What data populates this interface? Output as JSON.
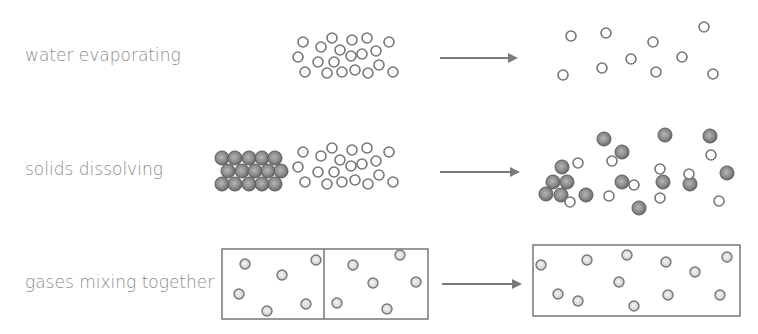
{
  "colors": {
    "text": "#8a8a8a",
    "outline": "#777777",
    "solid_fill": "#8c8c8c",
    "solid_stroke": "#5e5e5e",
    "arrow": "#7a7a7a",
    "box": "#777777",
    "gas_fill": "#e8e8e8"
  },
  "rows": [
    {
      "label": "water evaporating",
      "label_y": 42,
      "arrow": {
        "x1": 440,
        "x2": 516,
        "y": 58
      },
      "before_open": [
        [
          303,
          42
        ],
        [
          321,
          47
        ],
        [
          332,
          38
        ],
        [
          352,
          40
        ],
        [
          367,
          38
        ],
        [
          389,
          42
        ],
        [
          298,
          57
        ],
        [
          318,
          62
        ],
        [
          340,
          50
        ],
        [
          351,
          56
        ],
        [
          362,
          54
        ],
        [
          376,
          51
        ],
        [
          334,
          62
        ],
        [
          379,
          65
        ],
        [
          305,
          72
        ],
        [
          327,
          73
        ],
        [
          342,
          72
        ],
        [
          355,
          70
        ],
        [
          368,
          73
        ],
        [
          393,
          72
        ]
      ],
      "after_open": [
        [
          571,
          36
        ],
        [
          606,
          33
        ],
        [
          653,
          42
        ],
        [
          704,
          27
        ],
        [
          631,
          59
        ],
        [
          682,
          57
        ],
        [
          563,
          75
        ],
        [
          602,
          68
        ],
        [
          656,
          72
        ],
        [
          713,
          74
        ]
      ]
    },
    {
      "label": "solids dissolving",
      "label_y": 156,
      "arrow": {
        "x1": 440,
        "x2": 518,
        "y": 172
      },
      "before_solid": [
        [
          222,
          158
        ],
        [
          235,
          158
        ],
        [
          249,
          158
        ],
        [
          262,
          158
        ],
        [
          275,
          158
        ],
        [
          228,
          171
        ],
        [
          242,
          171
        ],
        [
          255,
          171
        ],
        [
          268,
          171
        ],
        [
          281,
          171
        ],
        [
          222,
          184
        ],
        [
          235,
          184
        ],
        [
          249,
          184
        ],
        [
          262,
          184
        ],
        [
          275,
          184
        ]
      ],
      "before_open": [
        [
          303,
          152
        ],
        [
          321,
          156
        ],
        [
          332,
          148
        ],
        [
          352,
          150
        ],
        [
          367,
          148
        ],
        [
          389,
          152
        ],
        [
          298,
          167
        ],
        [
          318,
          172
        ],
        [
          340,
          160
        ],
        [
          351,
          166
        ],
        [
          362,
          164
        ],
        [
          376,
          161
        ],
        [
          334,
          172
        ],
        [
          379,
          175
        ],
        [
          305,
          182
        ],
        [
          327,
          184
        ],
        [
          342,
          182
        ],
        [
          355,
          180
        ],
        [
          368,
          184
        ],
        [
          393,
          182
        ]
      ],
      "after_solid": [
        [
          562,
          167
        ],
        [
          553,
          182
        ],
        [
          567,
          182
        ],
        [
          546,
          194
        ],
        [
          561,
          195
        ],
        [
          586,
          195
        ],
        [
          604,
          139
        ],
        [
          622,
          152
        ],
        [
          622,
          182
        ],
        [
          639,
          208
        ],
        [
          665,
          135
        ],
        [
          663,
          182
        ],
        [
          710,
          136
        ],
        [
          727,
          173
        ],
        [
          690,
          184
        ]
      ],
      "after_open": [
        [
          578,
          163
        ],
        [
          570,
          202
        ],
        [
          612,
          161
        ],
        [
          609,
          196
        ],
        [
          660,
          169
        ],
        [
          660,
          198
        ],
        [
          634,
          185
        ],
        [
          689,
          174
        ],
        [
          711,
          155
        ],
        [
          719,
          201
        ]
      ]
    },
    {
      "label": "gases mixing together",
      "label_y": 270,
      "arrow": {
        "x1": 442,
        "x2": 520,
        "y": 284
      },
      "box_left": {
        "x": 222,
        "y": 249,
        "w": 206,
        "h": 70,
        "divider_x": 324
      },
      "box_right": {
        "x": 533,
        "y": 245,
        "w": 207,
        "h": 71
      },
      "before_gas": [
        [
          245,
          264
        ],
        [
          282,
          275
        ],
        [
          316,
          260
        ],
        [
          239,
          294
        ],
        [
          267,
          311
        ],
        [
          306,
          304
        ],
        [
          353,
          265
        ],
        [
          400,
          255
        ],
        [
          373,
          283
        ],
        [
          416,
          282
        ],
        [
          337,
          303
        ],
        [
          387,
          309
        ]
      ],
      "after_gas": [
        [
          541,
          265
        ],
        [
          587,
          260
        ],
        [
          627,
          255
        ],
        [
          666,
          262
        ],
        [
          695,
          272
        ],
        [
          727,
          257
        ],
        [
          558,
          294
        ],
        [
          578,
          301
        ],
        [
          619,
          282
        ],
        [
          634,
          306
        ],
        [
          668,
          295
        ],
        [
          720,
          295
        ]
      ]
    }
  ]
}
